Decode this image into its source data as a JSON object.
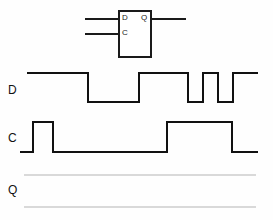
{
  "diagram": {
    "component": {
      "name": "d-flip-flop",
      "pins": {
        "d_input": "D",
        "clock_input": "C",
        "q_output": "Q"
      },
      "box": {
        "x": 118,
        "y": 10,
        "width": 34,
        "height": 48
      },
      "wires": [
        {
          "name": "d-input-wire",
          "x": 85,
          "y": 18,
          "length": 35
        },
        {
          "name": "clock-input-wire",
          "x": 85,
          "y": 33,
          "length": 35
        },
        {
          "name": "q-output-wire",
          "x": 150,
          "y": 18,
          "length": 36
        }
      ]
    },
    "rows": [
      {
        "name": "d-waveform",
        "label": "D",
        "label_x": 8,
        "label_y": 84,
        "high_y": 73,
        "low_y": 102,
        "start_x": 27,
        "end_x": 258,
        "initial_level": "high",
        "transitions": [
          {
            "x": 88,
            "to": "low"
          },
          {
            "x": 139,
            "to": "high"
          },
          {
            "x": 188,
            "to": "low"
          },
          {
            "x": 203,
            "to": "high"
          },
          {
            "x": 218,
            "to": "low"
          },
          {
            "x": 233,
            "to": "high"
          },
          {
            "x": 248,
            "to": "low"
          },
          {
            "x": 252,
            "to": "high"
          }
        ],
        "path": "M27,73 L88,73 L88,102 L139,102 L139,73 L188,73 L188,102 L203,102 L203,73 L218,73 L218,102 L233,102 L233,73 L258,73"
      },
      {
        "name": "c-waveform",
        "label": "C",
        "label_x": 8,
        "label_y": 132,
        "high_y": 122,
        "low_y": 152,
        "start_x": 20,
        "end_x": 258,
        "initial_level": "low",
        "transitions": [
          {
            "x": 33,
            "to": "high"
          },
          {
            "x": 53,
            "to": "low"
          },
          {
            "x": 167,
            "to": "high"
          },
          {
            "x": 232,
            "to": "low"
          }
        ],
        "path": "M20,152 L33,152 L33,122 L53,122 L53,152 L167,152 L167,122 L232,122 L232,152 L258,152"
      },
      {
        "name": "q-waveform",
        "label": "Q",
        "label_x": 8,
        "label_y": 184,
        "high_y": 175,
        "low_y": 207,
        "start_x": 24,
        "end_x": 258,
        "initial_level": "blank",
        "transitions": [],
        "guides": [
          {
            "name": "q-high-guide",
            "y": 175,
            "x1": 24,
            "x2": 256
          },
          {
            "name": "q-low-guide",
            "y": 207,
            "x1": 24,
            "x2": 256
          }
        ]
      }
    ],
    "colors": {
      "ink": "#111111",
      "box_stroke": "#1a1a1a",
      "guide": "#b4b4b4",
      "background": "#fefefe"
    }
  }
}
